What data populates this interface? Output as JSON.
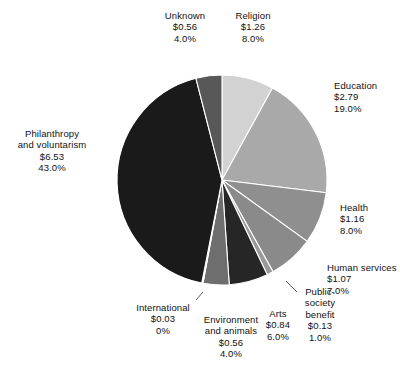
{
  "chart_data": {
    "type": "pie",
    "title": "",
    "subtitle": "",
    "xlabel": "",
    "ylabel": "",
    "legend_position": "labels-outside",
    "grid": false,
    "value_prefix": "$",
    "start_angle_deg": 0,
    "direction": "clockwise",
    "categories": [
      "Religion",
      "Education",
      "Health",
      "Human services",
      "Public-society benefit",
      "Arts",
      "Environment and animals",
      "International",
      "Philanthropy and voluntarism",
      "Unknown"
    ],
    "values": [
      1.26,
      2.79,
      1.16,
      1.07,
      0.13,
      0.84,
      0.56,
      0.03,
      6.53,
      0.56
    ],
    "percents": [
      8.0,
      19.0,
      8.0,
      7.0,
      1.0,
      6.0,
      4.0,
      0.0,
      43.0,
      4.0
    ],
    "colors": [
      "#d2d2d2",
      "#a9a9a9",
      "#8f8f8f",
      "#8a8a8a",
      "#9a9a9a",
      "#262626",
      "#6e6e6e",
      "#fdfdfd",
      "#1a1a1a",
      "#585858"
    ],
    "slices": [
      {
        "name": "Religion",
        "value_text": "$1.26",
        "percent_text": "8.0%",
        "value": 1.26,
        "percent": 8.0,
        "color": "#d2d2d2"
      },
      {
        "name": "Education",
        "value_text": "$2.79",
        "percent_text": "19.0%",
        "value": 2.79,
        "percent": 19.0,
        "color": "#a9a9a9"
      },
      {
        "name": "Health",
        "value_text": "$1.16",
        "percent_text": "8.0%",
        "value": 1.16,
        "percent": 8.0,
        "color": "#8f8f8f"
      },
      {
        "name": "Human services",
        "value_text": "$1.07",
        "percent_text": "7.0%",
        "value": 1.07,
        "percent": 7.0,
        "color": "#8a8a8a"
      },
      {
        "name": "Public-society benefit",
        "value_text": "$0.13",
        "percent_text": "1.0%",
        "value": 0.13,
        "percent": 1.0,
        "color": "#9a9a9a"
      },
      {
        "name": "Arts",
        "value_text": "$0.84",
        "percent_text": "6.0%",
        "value": 0.84,
        "percent": 6.0,
        "color": "#262626"
      },
      {
        "name": "Environment and animals",
        "value_text": "$0.56",
        "percent_text": "4.0%",
        "value": 0.56,
        "percent": 4.0,
        "color": "#6e6e6e"
      },
      {
        "name": "International",
        "value_text": "$0.03",
        "percent_text": "0%",
        "value": 0.03,
        "percent": 0.2,
        "color": "#fdfdfd"
      },
      {
        "name": "Philanthropy and voluntarism",
        "value_text": "$6.53",
        "percent_text": "43.0%",
        "value": 6.53,
        "percent": 43.0,
        "color": "#1a1a1a"
      },
      {
        "name": "Unknown",
        "value_text": "$0.56",
        "percent_text": "4.0%",
        "value": 0.56,
        "percent": 4.0,
        "color": "#585858"
      }
    ]
  },
  "labels": {
    "unknown": {
      "line1": "Unknown",
      "line2": "$0.56",
      "line3": "4.0%"
    },
    "religion": {
      "line1": "Religion",
      "line2": "$1.26",
      "line3": "8.0%"
    },
    "education": {
      "line1": "Education",
      "line2": "$2.79",
      "line3": "19.0%"
    },
    "health": {
      "line1": "Health",
      "line2": "$1.16",
      "line3": "8.0%"
    },
    "human_services": {
      "line1": "Human services",
      "line2": "$1.07",
      "line3": "7.0%"
    },
    "public_society": {
      "line1": "Public-",
      "line2": "society",
      "line3": "benefit",
      "line4": "$0.13",
      "line5": "1.0%"
    },
    "arts": {
      "line1": "Arts",
      "line2": "$0.84",
      "line3": "6.0%"
    },
    "environment": {
      "line1": "Environment",
      "line2": "and animals",
      "line3": "$0.56",
      "line4": "4.0%"
    },
    "international": {
      "line1": "International",
      "line2": "$0.03",
      "line3": "0%"
    },
    "philanthropy": {
      "line1": "Philanthropy",
      "line2": "and voluntarism",
      "line3": "$6.53",
      "line4": "43.0%"
    }
  },
  "geometry": {
    "center_x": 222,
    "center_y": 180,
    "radius": 105,
    "separator_color": "#ffffff",
    "separator_width": 1.1,
    "leader_color": "#4a4a4a"
  }
}
